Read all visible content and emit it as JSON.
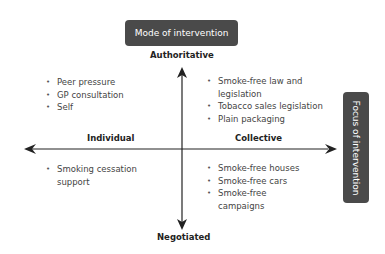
{
  "diagram": {
    "vertical_axis": {
      "title": "Mode of intervention",
      "top_label": "Authoritative",
      "bottom_label": "Negotiated"
    },
    "horizontal_axis": {
      "title": "Focus of intervention",
      "left_label": "Individual",
      "right_label": "Collective"
    },
    "quadrants": {
      "individual_authoritative": [
        "Peer pressure",
        "GP consultation",
        "Self"
      ],
      "collective_authoritative": [
        "Smoke-free law and legislation",
        "Tobacco sales legislation",
        "Plain packaging"
      ],
      "individual_negotiated": [
        "Smoking cessation support"
      ],
      "collective_negotiated": [
        "Smoke-free houses",
        "Smoke-free cars",
        "Smoke-free campaigns"
      ]
    },
    "colors": {
      "label_box": "#4a4a4a",
      "label_text": "#ffffff",
      "axis": "#222222",
      "text": "#444444"
    }
  }
}
